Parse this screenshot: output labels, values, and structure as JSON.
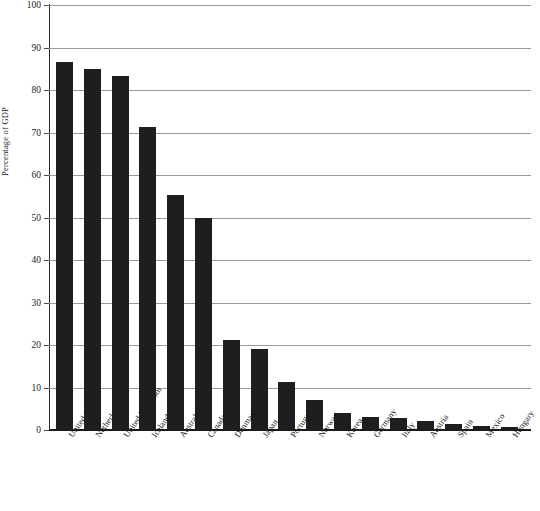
{
  "chart_data": {
    "type": "bar",
    "title": "",
    "xlabel": "",
    "ylabel": "Percentage of GDP",
    "ylim": [
      0,
      100
    ],
    "yticks": [
      0,
      10,
      20,
      30,
      40,
      50,
      60,
      70,
      80,
      90,
      100
    ],
    "ytick_labels": [
      "0",
      "10",
      "20",
      "30",
      "40",
      "50",
      "60",
      "70",
      "80",
      "90",
      "100"
    ],
    "grid": true,
    "legend": "none",
    "bar_color": "#1e1e1e",
    "gridline_color": "#9a9a9a",
    "axis_color": "#1a1a1a",
    "categories": [
      "United States",
      "Netherlands",
      "United Kingdom",
      "Iceland",
      "Australia",
      "Canada",
      "Denmark",
      "Japan",
      "Portugal",
      "Norway",
      "Korea",
      "Germany",
      "Italy",
      "Austria",
      "Spain",
      "Mexico",
      "Hungary"
    ],
    "values": [
      86.5,
      85.0,
      83.2,
      71.2,
      55.2,
      50.0,
      21.2,
      19.0,
      11.3,
      7.0,
      4.1,
      3.1,
      2.9,
      2.2,
      1.4,
      1.0,
      0.7
    ]
  }
}
